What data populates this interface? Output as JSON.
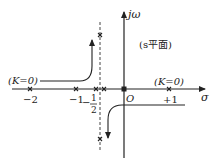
{
  "diagram": {
    "plane_label": "(s平面)",
    "axes": {
      "real_label": "σ",
      "imag_label": "jω",
      "origin_label": "O"
    },
    "real_axis_ticks": [
      {
        "value": -2,
        "label": "−2"
      },
      {
        "value": -1,
        "label": "−1"
      },
      {
        "value": 1,
        "label": "+1"
      }
    ],
    "asymptote": {
      "value": -0.5,
      "label_minus": "−",
      "label_num": "1",
      "label_den": "2"
    },
    "annotations": {
      "start_left": "(K=0)",
      "start_right": "(K=0)"
    },
    "poles_zeros": [
      {
        "re": -2,
        "im": 0
      },
      {
        "re": -1,
        "im": 0
      },
      {
        "re": -0.6,
        "im": 0
      },
      {
        "re": -0.4,
        "im": 0
      },
      {
        "re": 0,
        "im": 0
      },
      {
        "re": 1,
        "im": 0
      }
    ],
    "asymptote_marks": [
      {
        "re": -0.5,
        "im": "upper"
      },
      {
        "re": -0.5,
        "im": "lower"
      }
    ],
    "colors": {
      "line": "#222222",
      "dashed": "#444444"
    }
  }
}
